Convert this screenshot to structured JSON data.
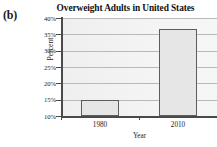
{
  "figure": {
    "label": "(b)"
  },
  "chart_data": {
    "type": "bar",
    "title": "Overweight Adults in United States",
    "xlabel": "Year",
    "ylabel": "Percent",
    "categories": [
      "1980",
      "2010"
    ],
    "values": [
      14.8,
      36.5
    ],
    "ylim": [
      10,
      40
    ],
    "ytick_values": [
      40,
      35,
      30,
      25,
      20,
      15,
      10
    ],
    "ytick_labels": [
      "40%",
      "35%",
      "30%",
      "25%",
      "20%",
      "15%",
      "10%"
    ],
    "grid": true,
    "legend": false,
    "bar_fill_color": "#e6e6e6",
    "bar_border_color": "#5d5d5d",
    "plot_background_color": "#f2f2f2",
    "gridline_color": "#b9b9b9",
    "axis_color": "#4a4a4a"
  }
}
